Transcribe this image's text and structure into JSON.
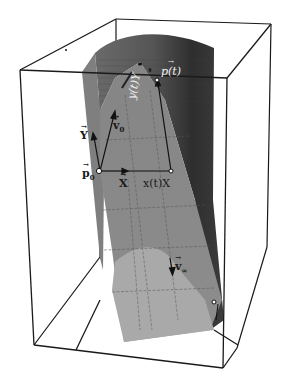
{
  "figure": {
    "type": "3d-surface-diagram"
  },
  "colors": {
    "background": "#ffffff",
    "box_edge": "#1a1a1a",
    "surface_dark": "#3a3a3a",
    "surface_mid": "#7a7a7a",
    "surface_light": "#a8a8a8",
    "surface_lightest": "#c4c4c4",
    "vector": "#111111",
    "point_fill": "#ffffff"
  },
  "labels": {
    "p_t": "p(t)",
    "y_t_Y": "y(t)Y",
    "v0": "v",
    "v0_sub": "0",
    "Y": "Y",
    "p0": "p",
    "p0_sub": "0",
    "X": "X",
    "x_t_X": "x(t)X",
    "v_inf": "v",
    "v_inf_sub": "∞"
  }
}
